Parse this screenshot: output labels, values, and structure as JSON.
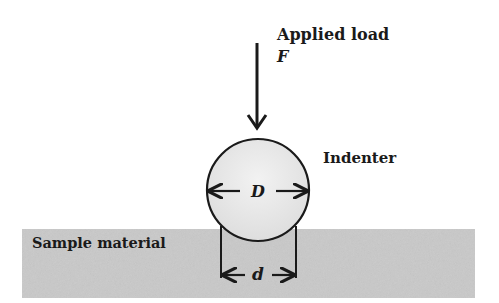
{
  "diagram": {
    "labels": {
      "applied_load": "Applied load",
      "force_symbol": "F",
      "indenter": "Indenter",
      "diameter_symbol": "D",
      "sample_material": "Sample material",
      "indent_diameter_symbol": "d"
    },
    "colors": {
      "sample_fill": "#c9c9c9",
      "indenter_fill": "#e8e8e8",
      "stroke": "#1a1a1a",
      "background": "#ffffff"
    }
  }
}
